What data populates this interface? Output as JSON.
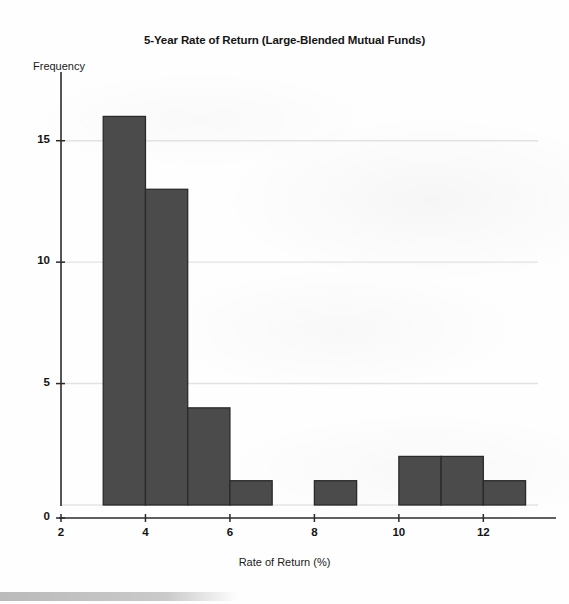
{
  "chart_data": {
    "type": "bar",
    "title": "5-Year Rate of Return (Large-Blended Mutual Funds)",
    "xlabel": "Rate of Return (%)",
    "ylabel": "Frequency",
    "xlim": [
      2,
      13.2
    ],
    "ylim": [
      0,
      17.5
    ],
    "grid": "horizontal",
    "legend": "none",
    "bar_color": "#4b4b4b",
    "bar_edge_color": "#2a2a2a",
    "bin_width": 1,
    "bins": [
      {
        "start": 3,
        "end": 4,
        "value": 16
      },
      {
        "start": 4,
        "end": 5,
        "value": 13
      },
      {
        "start": 5,
        "end": 6,
        "value": 4
      },
      {
        "start": 6,
        "end": 7,
        "value": 1
      },
      {
        "start": 8,
        "end": 9,
        "value": 1
      },
      {
        "start": 10,
        "end": 11,
        "value": 2
      },
      {
        "start": 11,
        "end": 12,
        "value": 2
      },
      {
        "start": 12,
        "end": 13,
        "value": 1
      }
    ],
    "categories": [
      "3-4",
      "4-5",
      "5-6",
      "6-7",
      "8-9",
      "10-11",
      "11-12",
      "12-13"
    ],
    "values": [
      16,
      13,
      4,
      1,
      1,
      2,
      2,
      1
    ],
    "y_ticks": [
      0,
      5,
      10,
      15
    ],
    "y_tick_labels": [
      "0",
      "5",
      "10",
      "15"
    ],
    "x_ticks": [
      2,
      4,
      6,
      8,
      10,
      12
    ],
    "x_tick_labels": [
      "2",
      "4",
      "6",
      "8",
      "10",
      "12"
    ]
  }
}
